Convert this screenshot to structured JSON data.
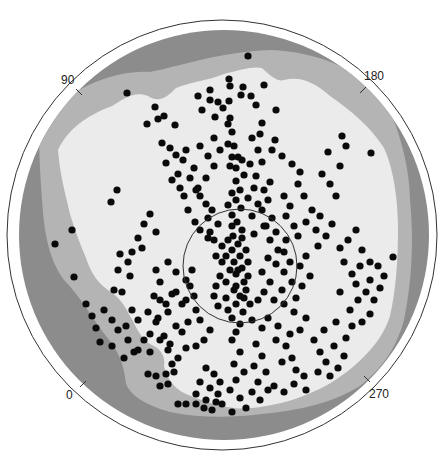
{
  "chart_data": {
    "type": "scatter",
    "subtype": "polar-sky-map",
    "title": "",
    "angle_labels": [
      {
        "label": "90",
        "angle_deg": 135,
        "x": 70,
        "y": 80
      },
      {
        "label": "180",
        "angle_deg": 45,
        "x": 364,
        "y": 74
      },
      {
        "label": "0",
        "angle_deg": 225,
        "x": 67,
        "y": 394
      },
      {
        "label": "270",
        "angle_deg": 315,
        "x": 369,
        "y": 392
      }
    ],
    "outer_circle": {
      "cx": 222,
      "cy": 235,
      "r": 215
    },
    "disk": {
      "cx": 224,
      "cy": 235,
      "r": 205
    },
    "inner_circle": {
      "cx": 240,
      "cy": 266,
      "r": 57
    },
    "colors": {
      "outer_band": "#8c8c8c",
      "middle_band": "#b4b4b4",
      "inner_region": "#ebebeb",
      "dots": "#0a0a0a",
      "lines": "#333333"
    },
    "legend": [],
    "grid": false,
    "points": [
      [
        248,
        56
      ],
      [
        127,
        93
      ],
      [
        371,
        153
      ],
      [
        393,
        257
      ],
      [
        72,
        230
      ],
      [
        55,
        244
      ],
      [
        74,
        277
      ],
      [
        117,
        190
      ],
      [
        111,
        202
      ],
      [
        147,
        124
      ],
      [
        158,
        119
      ],
      [
        155,
        107
      ],
      [
        164,
        116
      ],
      [
        175,
        125
      ],
      [
        229,
        79
      ],
      [
        241,
        95
      ],
      [
        243,
        87
      ],
      [
        251,
        96
      ],
      [
        256,
        105
      ],
      [
        264,
        85
      ],
      [
        262,
        123
      ],
      [
        260,
        134
      ],
      [
        276,
        110
      ],
      [
        275,
        140
      ],
      [
        272,
        150
      ],
      [
        282,
        156
      ],
      [
        230,
        86
      ],
      [
        229,
        101
      ],
      [
        218,
        102
      ],
      [
        210,
        100
      ],
      [
        215,
        117
      ],
      [
        223,
        108
      ],
      [
        230,
        118
      ],
      [
        228,
        124
      ],
      [
        232,
        132
      ],
      [
        228,
        144
      ],
      [
        234,
        146
      ],
      [
        232,
        157
      ],
      [
        238,
        157
      ],
      [
        230,
        166
      ],
      [
        236,
        168
      ],
      [
        242,
        160
      ],
      [
        244,
        175
      ],
      [
        236,
        181
      ],
      [
        240,
        190
      ],
      [
        232,
        193
      ],
      [
        236,
        200
      ],
      [
        228,
        205
      ],
      [
        241,
        208
      ],
      [
        232,
        215
      ],
      [
        237,
        222
      ],
      [
        242,
        230
      ],
      [
        233,
        236
      ],
      [
        238,
        244
      ],
      [
        232,
        250
      ],
      [
        240,
        256
      ],
      [
        234,
        262
      ],
      [
        242,
        268
      ],
      [
        236,
        274
      ],
      [
        244,
        282
      ],
      [
        234,
        290
      ],
      [
        240,
        296
      ],
      [
        236,
        304
      ],
      [
        243,
        312
      ],
      [
        232,
        318
      ],
      [
        240,
        324
      ],
      [
        236,
        332
      ],
      [
        242,
        238
      ],
      [
        228,
        240
      ],
      [
        246,
        250
      ],
      [
        226,
        256
      ],
      [
        248,
        262
      ],
      [
        230,
        270
      ],
      [
        226,
        282
      ],
      [
        248,
        276
      ],
      [
        246,
        290
      ],
      [
        226,
        298
      ],
      [
        250,
        304
      ],
      [
        228,
        310
      ],
      [
        244,
        298
      ],
      [
        236,
        286
      ],
      [
        238,
        270
      ],
      [
        232,
        226
      ],
      [
        186,
        150
      ],
      [
        183,
        160
      ],
      [
        194,
        168
      ],
      [
        190,
        178
      ],
      [
        178,
        174
      ],
      [
        196,
        190
      ],
      [
        200,
        196
      ],
      [
        206,
        204
      ],
      [
        212,
        210
      ],
      [
        208,
        218
      ],
      [
        218,
        224
      ],
      [
        210,
        232
      ],
      [
        214,
        240
      ],
      [
        222,
        246
      ],
      [
        216,
        256
      ],
      [
        222,
        262
      ],
      [
        220,
        276
      ],
      [
        216,
        286
      ],
      [
        214,
        296
      ],
      [
        218,
        306
      ],
      [
        162,
        143
      ],
      [
        170,
        148
      ],
      [
        176,
        155
      ],
      [
        166,
        163
      ],
      [
        172,
        180
      ],
      [
        180,
        188
      ],
      [
        184,
        196
      ],
      [
        188,
        210
      ],
      [
        195,
        222
      ],
      [
        200,
        230
      ],
      [
        208,
        238
      ],
      [
        270,
        182
      ],
      [
        264,
        190
      ],
      [
        268,
        200
      ],
      [
        262,
        210
      ],
      [
        272,
        218
      ],
      [
        266,
        226
      ],
      [
        276,
        232
      ],
      [
        270,
        240
      ],
      [
        278,
        250
      ],
      [
        268,
        258
      ],
      [
        276,
        264
      ],
      [
        262,
        272
      ],
      [
        270,
        282
      ],
      [
        264,
        292
      ],
      [
        274,
        300
      ],
      [
        258,
        300
      ],
      [
        292,
        164
      ],
      [
        300,
        172
      ],
      [
        298,
        184
      ],
      [
        304,
        196
      ],
      [
        312,
        210
      ],
      [
        306,
        222
      ],
      [
        316,
        230
      ],
      [
        320,
        216
      ],
      [
        326,
        236
      ],
      [
        332,
        224
      ],
      [
        318,
        246
      ],
      [
        306,
        256
      ],
      [
        300,
        266
      ],
      [
        310,
        276
      ],
      [
        302,
        286
      ],
      [
        296,
        298
      ],
      [
        322,
        174
      ],
      [
        330,
        184
      ],
      [
        336,
        196
      ],
      [
        328,
        152
      ],
      [
        346,
        146
      ],
      [
        340,
        166
      ],
      [
        342,
        136
      ],
      [
        150,
        214
      ],
      [
        144,
        224
      ],
      [
        156,
        232
      ],
      [
        138,
        238
      ],
      [
        142,
        248
      ],
      [
        132,
        252
      ],
      [
        120,
        254
      ],
      [
        128,
        262
      ],
      [
        118,
        270
      ],
      [
        130,
        276
      ],
      [
        114,
        290
      ],
      [
        122,
        292
      ],
      [
        154,
        296
      ],
      [
        160,
        300
      ],
      [
        166,
        304
      ],
      [
        172,
        294
      ],
      [
        168,
        312
      ],
      [
        158,
        318
      ],
      [
        176,
        326
      ],
      [
        182,
        332
      ],
      [
        164,
        336
      ],
      [
        170,
        344
      ],
      [
        186,
        348
      ],
      [
        196,
        346
      ],
      [
        204,
        340
      ],
      [
        210,
        330
      ],
      [
        200,
        320
      ],
      [
        148,
        312
      ],
      [
        156,
        322
      ],
      [
        150,
        334
      ],
      [
        160,
        340
      ],
      [
        168,
        350
      ],
      [
        178,
        358
      ],
      [
        172,
        364
      ],
      [
        190,
        286
      ],
      [
        194,
        296
      ],
      [
        182,
        304
      ],
      [
        196,
        310
      ],
      [
        188,
        322
      ],
      [
        232,
        340
      ],
      [
        240,
        352
      ],
      [
        234,
        364
      ],
      [
        244,
        372
      ],
      [
        236,
        380
      ],
      [
        230,
        390
      ],
      [
        240,
        398
      ],
      [
        246,
        408
      ],
      [
        232,
        412
      ],
      [
        222,
        404
      ],
      [
        206,
        368
      ],
      [
        214,
        374
      ],
      [
        220,
        382
      ],
      [
        210,
        388
      ],
      [
        200,
        382
      ],
      [
        196,
        394
      ],
      [
        206,
        400
      ],
      [
        218,
        394
      ],
      [
        256,
        344
      ],
      [
        262,
        356
      ],
      [
        254,
        366
      ],
      [
        266,
        372
      ],
      [
        258,
        382
      ],
      [
        268,
        390
      ],
      [
        252,
        392
      ],
      [
        260,
        400
      ],
      [
        276,
        340
      ],
      [
        286,
        346
      ],
      [
        292,
        358
      ],
      [
        282,
        362
      ],
      [
        296,
        370
      ],
      [
        304,
        376
      ],
      [
        294,
        384
      ],
      [
        306,
        390
      ],
      [
        284,
        392
      ],
      [
        274,
        386
      ],
      [
        314,
        340
      ],
      [
        320,
        352
      ],
      [
        326,
        362
      ],
      [
        318,
        372
      ],
      [
        330,
        376
      ],
      [
        338,
        368
      ],
      [
        344,
        356
      ],
      [
        334,
        346
      ],
      [
        324,
        330
      ],
      [
        336,
        322
      ],
      [
        350,
        310
      ],
      [
        358,
        300
      ],
      [
        366,
        292
      ],
      [
        374,
        300
      ],
      [
        370,
        314
      ],
      [
        362,
        322
      ],
      [
        352,
        326
      ],
      [
        346,
        338
      ],
      [
        340,
        292
      ],
      [
        356,
        284
      ],
      [
        370,
        280
      ],
      [
        380,
        288
      ],
      [
        362,
        250
      ],
      [
        370,
        262
      ],
      [
        360,
        266
      ],
      [
        352,
        274
      ],
      [
        344,
        262
      ],
      [
        378,
        266
      ],
      [
        384,
        276
      ],
      [
        348,
        240
      ],
      [
        356,
        230
      ],
      [
        340,
        248
      ],
      [
        192,
        270
      ],
      [
        186,
        280
      ],
      [
        176,
        272
      ],
      [
        168,
        262
      ],
      [
        156,
        270
      ],
      [
        160,
        282
      ],
      [
        176,
        292
      ],
      [
        186,
        300
      ],
      [
        132,
        310
      ],
      [
        138,
        320
      ],
      [
        126,
        326
      ],
      [
        144,
        340
      ],
      [
        150,
        352
      ],
      [
        138,
        350
      ],
      [
        86,
        304
      ],
      [
        92,
        316
      ],
      [
        96,
        328
      ],
      [
        104,
        310
      ],
      [
        112,
        320
      ],
      [
        118,
        330
      ],
      [
        128,
        340
      ],
      [
        134,
        352
      ],
      [
        124,
        358
      ],
      [
        112,
        346
      ],
      [
        100,
        342
      ],
      [
        178,
        404
      ],
      [
        186,
        404
      ],
      [
        196,
        404
      ],
      [
        204,
        408
      ],
      [
        212,
        410
      ],
      [
        216,
        402
      ],
      [
        148,
        374
      ],
      [
        156,
        376
      ],
      [
        166,
        374
      ],
      [
        174,
        372
      ],
      [
        168,
        384
      ],
      [
        160,
        386
      ],
      [
        210,
        90
      ],
      [
        198,
        96
      ],
      [
        202,
        110
      ],
      [
        214,
        138
      ],
      [
        220,
        150
      ],
      [
        208,
        156
      ],
      [
        200,
        146
      ],
      [
        214,
        166
      ],
      [
        206,
        178
      ],
      [
        198,
        188
      ],
      [
        252,
        138
      ],
      [
        258,
        150
      ],
      [
        250,
        164
      ],
      [
        256,
        176
      ],
      [
        262,
        162
      ],
      [
        254,
        188
      ],
      [
        248,
        198
      ],
      [
        258,
        204
      ],
      [
        252,
        216
      ],
      [
        264,
        226
      ],
      [
        254,
        234
      ],
      [
        284,
        196
      ],
      [
        290,
        206
      ],
      [
        286,
        216
      ],
      [
        294,
        226
      ],
      [
        298,
        236
      ],
      [
        286,
        240
      ],
      [
        284,
        252
      ],
      [
        290,
        262
      ],
      [
        284,
        272
      ],
      [
        292,
        282
      ],
      [
        282,
        290
      ],
      [
        284,
        304
      ],
      [
        294,
        312
      ],
      [
        306,
        318
      ],
      [
        300,
        330
      ],
      [
        290,
        334
      ],
      [
        278,
        326
      ],
      [
        268,
        318
      ],
      [
        262,
        328
      ],
      [
        252,
        320
      ]
    ]
  }
}
